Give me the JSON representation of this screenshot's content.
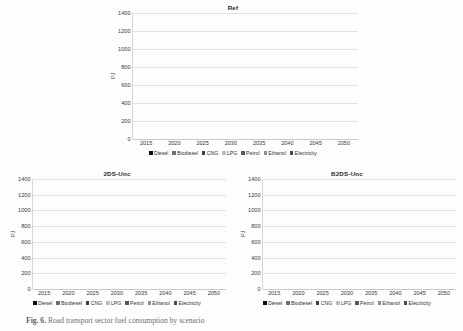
{
  "figure": {
    "caption_prefix": "Fig. 6.",
    "caption_text": "Road transport sector fuel consumption by scenario"
  },
  "axis": {
    "ylabel": "PJ",
    "ticks": [
      0,
      200,
      400,
      600,
      800,
      1000,
      1200,
      1400
    ],
    "ymin": 0,
    "ymax": 1400,
    "categories": [
      "2015",
      "2020",
      "2025",
      "2030",
      "2035",
      "2040",
      "2045",
      "2050"
    ]
  },
  "legend": {
    "items": [
      {
        "label": "Diesel",
        "color": "#0d0d0d"
      },
      {
        "label": "Biodiesel",
        "color": "#6e6e6e"
      },
      {
        "label": "CNG",
        "color": "#3f3f3f"
      },
      {
        "label": "LPG",
        "color": "#bdbdbd"
      },
      {
        "label": "Petrol",
        "color": "#575757"
      },
      {
        "label": "Ethanol",
        "color": "#8f8f8f"
      },
      {
        "label": "Electricity",
        "color": "#4a4a4a"
      }
    ]
  },
  "chart_data": [
    {
      "type": "bar",
      "title": "Ref",
      "stacked": true,
      "xlabel": "",
      "ylabel": "PJ",
      "ylim": [
        0,
        1400
      ],
      "grid": true,
      "legend_position": "bottom",
      "categories": [
        "2015",
        "2020",
        "2025",
        "2030",
        "2035",
        "2040",
        "2045",
        "2050"
      ],
      "series": [
        {
          "name": "Diesel",
          "color": "#0d0d0d",
          "values": [
            490,
            630,
            565,
            400,
            230,
            250,
            265,
            290
          ]
        },
        {
          "name": "Biodiesel",
          "color": "#6e6e6e",
          "values": [
            25,
            20,
            20,
            20,
            15,
            15,
            15,
            15
          ]
        },
        {
          "name": "CNG",
          "color": "#3f3f3f",
          "values": [
            10,
            10,
            10,
            30,
            10,
            10,
            10,
            10
          ]
        },
        {
          "name": "LPG",
          "color": "#bdbdbd",
          "values": [
            8,
            8,
            8,
            8,
            8,
            8,
            8,
            8
          ]
        },
        {
          "name": "Petrol",
          "color": "#575757",
          "values": [
            610,
            595,
            615,
            580,
            595,
            625,
            660,
            695
          ]
        },
        {
          "name": "Ethanol",
          "color": "#8f8f8f",
          "values": [
            12,
            12,
            12,
            12,
            12,
            12,
            12,
            12
          ]
        },
        {
          "name": "Electricity",
          "color": "#4a4a4a",
          "values": [
            5,
            5,
            5,
            100,
            160,
            170,
            190,
            205
          ]
        }
      ],
      "totals": [
        1160,
        1280,
        1235,
        1150,
        1030,
        1090,
        1160,
        1235
      ]
    },
    {
      "type": "bar",
      "title": "2DS-Unc",
      "stacked": true,
      "xlabel": "",
      "ylabel": "PJ",
      "ylim": [
        0,
        1400
      ],
      "grid": true,
      "legend_position": "bottom",
      "categories": [
        "2015",
        "2020",
        "2025",
        "2030",
        "2035",
        "2040",
        "2045",
        "2050"
      ],
      "series": [
        {
          "name": "Diesel",
          "color": "#0d0d0d",
          "values": [
            490,
            630,
            480,
            395,
            225,
            235,
            260,
            290
          ]
        },
        {
          "name": "Biodiesel",
          "color": "#6e6e6e",
          "values": [
            25,
            20,
            45,
            35,
            30,
            35,
            40,
            45
          ]
        },
        {
          "name": "CNG",
          "color": "#3f3f3f",
          "values": [
            10,
            10,
            40,
            30,
            15,
            15,
            15,
            15
          ]
        },
        {
          "name": "LPG",
          "color": "#bdbdbd",
          "values": [
            8,
            8,
            8,
            8,
            8,
            8,
            8,
            8
          ]
        },
        {
          "name": "Petrol",
          "color": "#575757",
          "values": [
            610,
            595,
            600,
            540,
            560,
            575,
            590,
            620
          ]
        },
        {
          "name": "Ethanol",
          "color": "#8f8f8f",
          "values": [
            12,
            12,
            40,
            70,
            105,
            110,
            120,
            130
          ]
        },
        {
          "name": "Electricity",
          "color": "#4a4a4a",
          "values": [
            5,
            5,
            12,
            72,
            87,
            102,
            117,
            122
          ]
        }
      ],
      "totals": [
        1160,
        1280,
        1225,
        1150,
        1030,
        1080,
        1150,
        1230
      ]
    },
    {
      "type": "bar",
      "title": "B2DS-Unc",
      "stacked": true,
      "xlabel": "",
      "ylabel": "PJ",
      "ylim": [
        0,
        1400
      ],
      "grid": true,
      "legend_position": "bottom",
      "categories": [
        "2015",
        "2020",
        "2025",
        "2030",
        "2035",
        "2040",
        "2045",
        "2050"
      ],
      "series": [
        {
          "name": "Diesel",
          "color": "#0d0d0d",
          "values": [
            490,
            615,
            500,
            455,
            345,
            365,
            420,
            480
          ]
        },
        {
          "name": "Biodiesel",
          "color": "#6e6e6e",
          "values": [
            25,
            20,
            25,
            35,
            30,
            30,
            35,
            35
          ]
        },
        {
          "name": "CNG",
          "color": "#3f3f3f",
          "values": [
            10,
            10,
            60,
            30,
            25,
            25,
            25,
            25
          ]
        },
        {
          "name": "LPG",
          "color": "#bdbdbd",
          "values": [
            8,
            8,
            8,
            8,
            8,
            8,
            8,
            8
          ]
        },
        {
          "name": "Petrol",
          "color": "#575757",
          "values": [
            600,
            580,
            470,
            330,
            230,
            200,
            180,
            175
          ]
        },
        {
          "name": "Ethanol",
          "color": "#8f8f8f",
          "values": [
            12,
            12,
            65,
            75,
            105,
            120,
            135,
            145
          ]
        },
        {
          "name": "Electricity",
          "color": "#4a4a4a",
          "values": [
            15,
            15,
            22,
            72,
            97,
            132,
            137,
            142
          ]
        }
      ],
      "totals": [
        1160,
        1260,
        1150,
        1005,
        840,
        880,
        940,
        1010
      ]
    }
  ]
}
